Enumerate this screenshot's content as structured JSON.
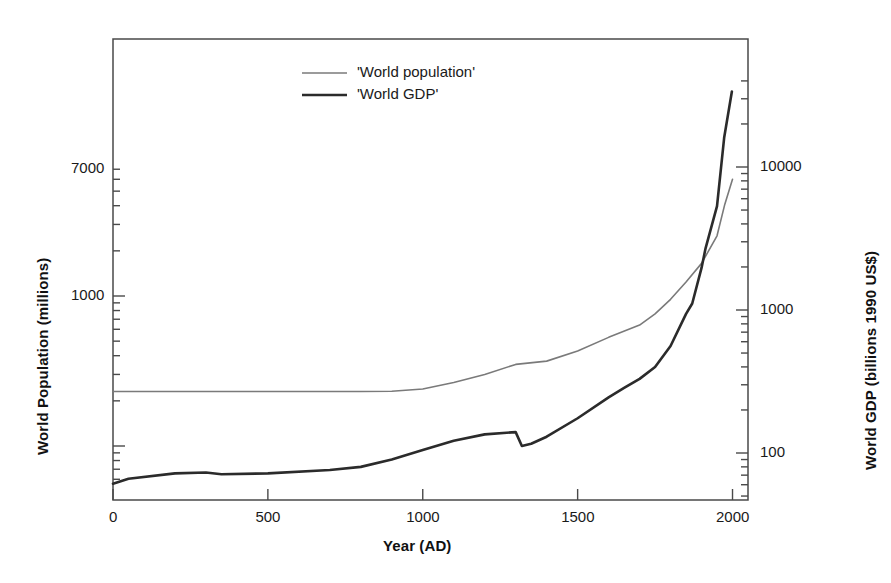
{
  "chart_data": {
    "type": "line",
    "title": "",
    "xlabel": "Year (AD)",
    "ylabel_left": "World Population (millions)",
    "ylabel_right": "World GDP (billions 1990 US$)",
    "xlim": [
      0,
      2050
    ],
    "x_ticks": [
      0,
      500,
      1000,
      1500,
      2000
    ],
    "x_tick_labels": [
      "0",
      "500",
      "1000",
      "1500",
      "2000"
    ],
    "y_left_scale": "log",
    "y_left_lim": [
      55,
      7000
    ],
    "y_left_ticks": [
      100,
      1000,
      7000
    ],
    "y_left_tick_labels": [
      "100",
      "1000",
      "7000"
    ],
    "y_left_labeled_ticks": [
      1000,
      7000
    ],
    "y_left_labeled_tick_labels": [
      "1000",
      "7000"
    ],
    "y_right_scale": "log",
    "y_right_lim": [
      55,
      40000
    ],
    "y_right_ticks": [
      100,
      1000,
      10000
    ],
    "y_right_tick_labels": [
      "100",
      "1000",
      "10000"
    ],
    "grid": false,
    "legend_position": "top-center",
    "series": [
      {
        "name": "'World population'",
        "color": "#7a7a7a",
        "width": 1.6,
        "axis": "left",
        "points": [
          [
            0,
            231
          ],
          [
            200,
            231
          ],
          [
            400,
            231
          ],
          [
            600,
            231
          ],
          [
            800,
            231
          ],
          [
            900,
            232
          ],
          [
            1000,
            240
          ],
          [
            1100,
            265
          ],
          [
            1200,
            300
          ],
          [
            1300,
            350
          ],
          [
            1400,
            368
          ],
          [
            1500,
            430
          ],
          [
            1600,
            530
          ],
          [
            1700,
            640
          ],
          [
            1750,
            760
          ],
          [
            1800,
            950
          ],
          [
            1850,
            1240
          ],
          [
            1900,
            1650
          ],
          [
            1950,
            2520
          ],
          [
            1975,
            4080
          ],
          [
            2000,
            6000
          ]
        ]
      },
      {
        "name": "'World GDP'",
        "color": "#2b2b2b",
        "width": 2.6,
        "axis": "right",
        "points": [
          [
            0,
            61
          ],
          [
            50,
            66
          ],
          [
            200,
            72
          ],
          [
            300,
            73
          ],
          [
            350,
            71
          ],
          [
            500,
            72
          ],
          [
            700,
            76
          ],
          [
            800,
            80
          ],
          [
            900,
            90
          ],
          [
            1000,
            105
          ],
          [
            1100,
            122
          ],
          [
            1200,
            135
          ],
          [
            1300,
            140
          ],
          [
            1320,
            112
          ],
          [
            1350,
            116
          ],
          [
            1400,
            130
          ],
          [
            1500,
            175
          ],
          [
            1600,
            245
          ],
          [
            1650,
            285
          ],
          [
            1700,
            330
          ],
          [
            1750,
            400
          ],
          [
            1800,
            560
          ],
          [
            1850,
            940
          ],
          [
            1870,
            1110
          ],
          [
            1900,
            1970
          ],
          [
            1913,
            2700
          ],
          [
            1950,
            5330
          ],
          [
            1973,
            16000
          ],
          [
            1998,
            33700
          ]
        ]
      }
    ]
  },
  "legend": {
    "items": [
      {
        "label": "'World population'"
      },
      {
        "label": "'World GDP'"
      }
    ]
  },
  "colors": {
    "population": "#7a7a7a",
    "gdp": "#2b2b2b",
    "axis": "#4a4a4a",
    "background": "#ffffff"
  }
}
